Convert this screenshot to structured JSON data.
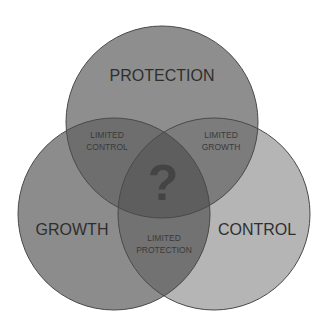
{
  "diagram": {
    "type": "venn",
    "circles": [
      {
        "id": "protection",
        "label": "PROTECTION",
        "fill": "#8e8e8e"
      },
      {
        "id": "growth",
        "label": "GROWTH",
        "fill": "#8c8c8c"
      },
      {
        "id": "control",
        "label": "CONTROL",
        "fill": "#b5b5b5"
      }
    ],
    "overlaps": {
      "protection_growth": [
        "LIMITED",
        "CONTROL"
      ],
      "protection_control": [
        "LIMITED",
        "GROWTH"
      ],
      "growth_control": [
        "LIMITED",
        "PROTECTION"
      ],
      "center": "?"
    },
    "stroke": "#4a4a4a"
  }
}
